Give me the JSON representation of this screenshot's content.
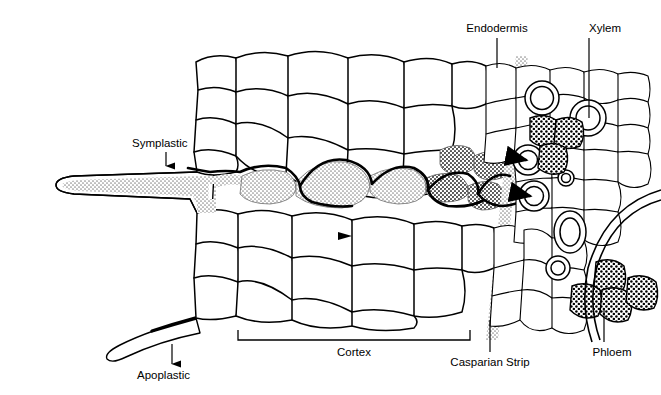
{
  "figure": {
    "background": "#ffffff",
    "ink": "#000000"
  },
  "labels": {
    "symplastic": "Symplastic",
    "apoplastic": "Apoplastic",
    "cortex": "Cortex",
    "casparian_strip": "Casparian Strip",
    "endodermis": "Endodermis",
    "xylem": "Xylem",
    "phloem": "Phloem"
  },
  "structures": {
    "root_hair_upper": "root-hair-upper",
    "root_hair_lower": "root-hair-lower",
    "epidermis": "epidermis",
    "cortex_cells": "cortex-cells",
    "endodermis_layer": "endodermis-layer",
    "casparian_band": "casparian-band",
    "pericycle": "pericycle",
    "xylem_vessels": "xylem-vessels",
    "phloem_cells": "phloem-cells",
    "stele_arc": "stele-arc"
  },
  "pathways": {
    "apoplastic_style": "stippled band along cell walls",
    "symplastic_style": "solid dark line through cell interiors",
    "apoplastic_color": "#9a9a9a",
    "symplastic_color": "#000000"
  }
}
